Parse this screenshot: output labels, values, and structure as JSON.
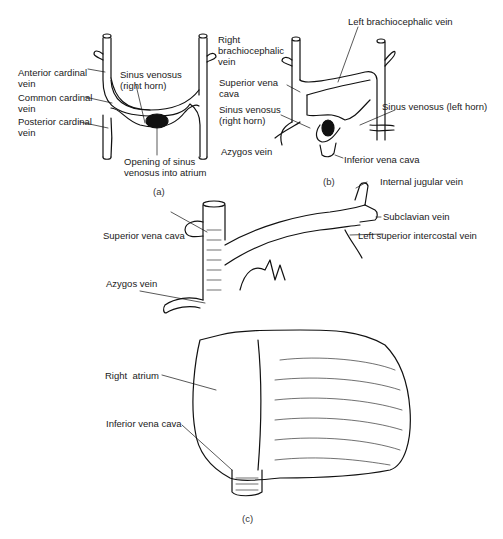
{
  "figure": {
    "panels": [
      {
        "id": "a",
        "caption": "(a)",
        "labels": {
          "anterior_cardinal": "Anterior cardinal\nvein",
          "common_cardinal": "Common cardinal\nvein",
          "posterior_cardinal": "Posterior cardinal\nvein",
          "sinus_right_horn": "Sinus venosus\n(right horn)",
          "opening": "Opening of sinus\nvenosus into atrium"
        }
      },
      {
        "id": "b",
        "caption": "(b)",
        "labels": {
          "right_brachiocephalic": "Right\nbrachiocephalic\nvein",
          "superior_vena_cava": "Superior vena\ncava",
          "sinus_right_horn": "Sinus venosus\n(right horn)",
          "azygos": "Azygos vein",
          "left_brachiocephalic": "Left brachiocephalic vein",
          "sinus_left_horn": "Sinus venosus (left horn)",
          "inferior_vena_cava": "Inferior vena cava"
        }
      },
      {
        "id": "c",
        "caption": "(c)",
        "labels": {
          "internal_jugular": "Internal jugular vein",
          "subclavian": "Subclavian vein",
          "left_superior_intercostal": "Left superior intercostal vein",
          "superior_vena_cava": "Superior vena cava",
          "azygos": "Azygos vein",
          "right_atrium": "Right  atrium",
          "inferior_vena_cava": "Inferior vena cava"
        }
      }
    ]
  }
}
